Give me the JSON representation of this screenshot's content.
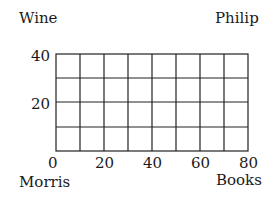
{
  "corners": {
    "top_left": "Wine",
    "top_right": "Philip",
    "bottom_left": "Morris",
    "bottom_right": "Books"
  },
  "grid": {
    "columns": 8,
    "rows": 4,
    "line_color": "#222222"
  },
  "x_axis": {
    "ticks": [
      "0",
      "20",
      "40",
      "60",
      "80"
    ],
    "range": [
      0,
      80
    ]
  },
  "y_axis": {
    "ticks": [
      "40",
      "20"
    ],
    "range": [
      0,
      40
    ]
  }
}
